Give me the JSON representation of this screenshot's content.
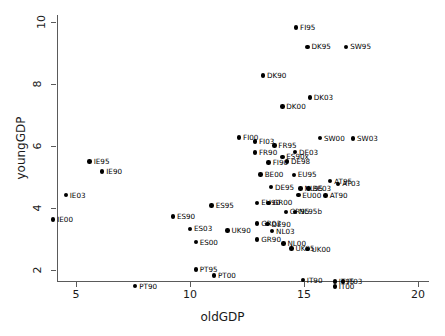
{
  "chart_data": {
    "type": "scatter",
    "title": "",
    "xlabel": "oldGDP",
    "ylabel": "youngGDP",
    "xlim": [
      3.7,
      20.3
    ],
    "ylim": [
      1.2,
      10.25
    ],
    "xticks": [
      5,
      10,
      15,
      20
    ],
    "yticks": [
      2,
      4,
      6,
      8,
      10
    ],
    "grid": false,
    "legend": "none",
    "point_color": "#000000",
    "points": [
      {
        "label": "FI95",
        "x": 14.65,
        "y": 9.82
      },
      {
        "label": "DK95",
        "x": 15.15,
        "y": 9.2
      },
      {
        "label": "SW95",
        "x": 16.85,
        "y": 9.2
      },
      {
        "label": "DK90",
        "x": 13.2,
        "y": 8.28
      },
      {
        "label": "DK03",
        "x": 15.25,
        "y": 7.57
      },
      {
        "label": "DK00",
        "x": 14.05,
        "y": 7.27
      },
      {
        "label": "FI00",
        "x": 12.15,
        "y": 6.27
      },
      {
        "label": "SW00",
        "x": 15.7,
        "y": 6.25
      },
      {
        "label": "SW03",
        "x": 17.15,
        "y": 6.24
      },
      {
        "label": "FI03",
        "x": 12.85,
        "y": 6.15
      },
      {
        "label": "FR95",
        "x": 13.7,
        "y": 6.02
      },
      {
        "label": "FR90",
        "x": 12.85,
        "y": 5.79
      },
      {
        "label": "DE03",
        "x": 14.6,
        "y": 5.8
      },
      {
        "label": "ES90x",
        "x": 14.05,
        "y": 5.65
      },
      {
        "label": "FI90",
        "x": 13.45,
        "y": 5.47
      },
      {
        "label": "DE98",
        "x": 14.25,
        "y": 5.5
      },
      {
        "label": "BE00",
        "x": 13.1,
        "y": 5.08
      },
      {
        "label": "EU95",
        "x": 14.55,
        "y": 5.07
      },
      {
        "label": "AT95",
        "x": 16.15,
        "y": 4.87
      },
      {
        "label": "AT03",
        "x": 16.5,
        "y": 4.78
      },
      {
        "label": "DE95",
        "x": 13.55,
        "y": 4.67
      },
      {
        "label": "NL95",
        "x": 14.85,
        "y": 4.63
      },
      {
        "label": "BE03",
        "x": 15.2,
        "y": 4.63
      },
      {
        "label": "EU00",
        "x": 14.75,
        "y": 4.42
      },
      {
        "label": "AT90",
        "x": 15.95,
        "y": 4.4
      },
      {
        "label": "IE95",
        "x": 5.6,
        "y": 5.5
      },
      {
        "label": "IE90",
        "x": 6.15,
        "y": 5.18
      },
      {
        "label": "IE03",
        "x": 4.55,
        "y": 4.41
      },
      {
        "label": "IE00",
        "x": 4.0,
        "y": 3.63
      },
      {
        "label": "EU90",
        "x": 12.95,
        "y": 4.17
      },
      {
        "label": "GR00",
        "x": 13.45,
        "y": 4.17
      },
      {
        "label": "ES95",
        "x": 10.95,
        "y": 4.08
      },
      {
        "label": "GR95",
        "x": 14.2,
        "y": 3.88
      },
      {
        "label": "NL95b",
        "x": 14.6,
        "y": 3.88
      },
      {
        "label": "ES90",
        "x": 9.25,
        "y": 3.72
      },
      {
        "label": "GR03",
        "x": 12.95,
        "y": 3.5
      },
      {
        "label": "DE90",
        "x": 13.4,
        "y": 3.48
      },
      {
        "label": "ES03",
        "x": 10.0,
        "y": 3.33
      },
      {
        "label": "UK90",
        "x": 11.65,
        "y": 3.27
      },
      {
        "label": "NL03",
        "x": 13.6,
        "y": 3.26
      },
      {
        "label": "GR90",
        "x": 12.95,
        "y": 2.98
      },
      {
        "label": "ES00",
        "x": 10.25,
        "y": 2.9
      },
      {
        "label": "NL00",
        "x": 14.1,
        "y": 2.86
      },
      {
        "label": "UK95",
        "x": 14.45,
        "y": 2.7
      },
      {
        "label": "UK00",
        "x": 15.15,
        "y": 2.68
      },
      {
        "label": "PT95",
        "x": 10.25,
        "y": 2.02
      },
      {
        "label": "PT00",
        "x": 11.05,
        "y": 1.82
      },
      {
        "label": "PT90",
        "x": 7.6,
        "y": 1.48
      },
      {
        "label": "IT90",
        "x": 14.95,
        "y": 1.68
      },
      {
        "label": "IT95",
        "x": 16.35,
        "y": 1.63
      },
      {
        "label": "IT03",
        "x": 16.7,
        "y": 1.63
      },
      {
        "label": "IT00",
        "x": 16.35,
        "y": 1.47
      }
    ]
  }
}
